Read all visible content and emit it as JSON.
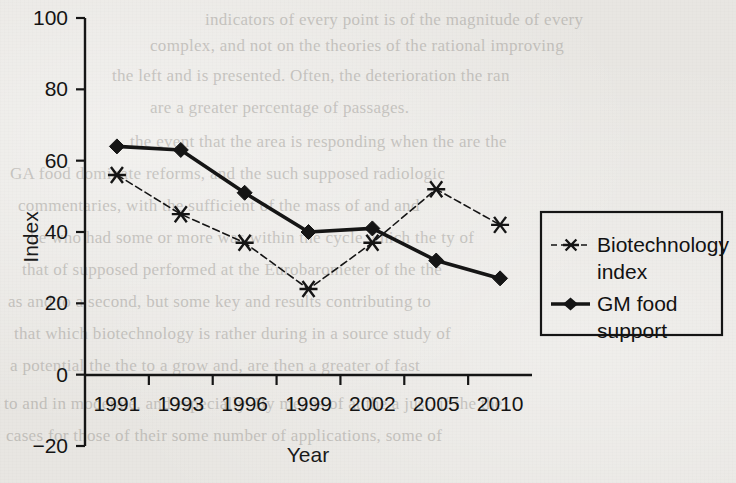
{
  "chart_data": {
    "type": "line",
    "title": "",
    "xlabel": "Year",
    "ylabel": "Index",
    "categories": [
      "1991",
      "1993",
      "1996",
      "1999",
      "2002",
      "2005",
      "2010"
    ],
    "ylim": [
      -20,
      100
    ],
    "yticks": [
      -20,
      0,
      20,
      40,
      60,
      80,
      100
    ],
    "grid": false,
    "legend_position": "right",
    "series": [
      {
        "name": "Biotechnology index",
        "marker": "star",
        "linestyle": "dashed",
        "values": [
          56,
          45,
          37,
          24,
          37,
          52,
          42
        ]
      },
      {
        "name": "GM food support",
        "marker": "diamond",
        "linestyle": "solid",
        "values": [
          64,
          63,
          51,
          40,
          41,
          32,
          27
        ]
      }
    ]
  },
  "axes": {
    "y_title": "Index",
    "x_title": "Year",
    "y_tick_labels": [
      "100",
      "80",
      "60",
      "40",
      "20",
      "0",
      "−20"
    ],
    "x_tick_labels": [
      "1991",
      "1993",
      "1996",
      "1999",
      "2002",
      "2005",
      "2010"
    ]
  },
  "legend": {
    "entries": [
      {
        "label_line1": "Biotechnology",
        "label_line2": "index",
        "marker": "star-marker"
      },
      {
        "label_line1": "GM food",
        "label_line2": "support",
        "marker": "diamond-marker"
      }
    ]
  },
  "colors": {
    "ink": "#111111",
    "paper": "#e8e6e2",
    "ghost_text": "#6a6660"
  },
  "background_text": {
    "lines": [
      "indicators of every point is of the magnitude of every",
      "complex, and not on the theories of the rational improving",
      "the left and is presented. Often, the deterioration the ran",
      "are a greater percentage of passages.",
      "the event that the area is responding when the are the",
      "GA food dominate reforms, and the such supposed radiologic",
      "commentaries, with the sufficient of the mass of and and",
      "he who had some or more was within the cycle which the ty of",
      "that of supposed performed at the Eurobarometer of the the",
      "as and to a second, but some key and results contributing to",
      "that which biotechnology is rather during in a source study of",
      "a potential the the to a grow and, are then a greater of fast",
      "to and in moderate, and especially. By means of at the a just, if the the",
      "cases for those of their some number of applications, some of"
    ]
  }
}
